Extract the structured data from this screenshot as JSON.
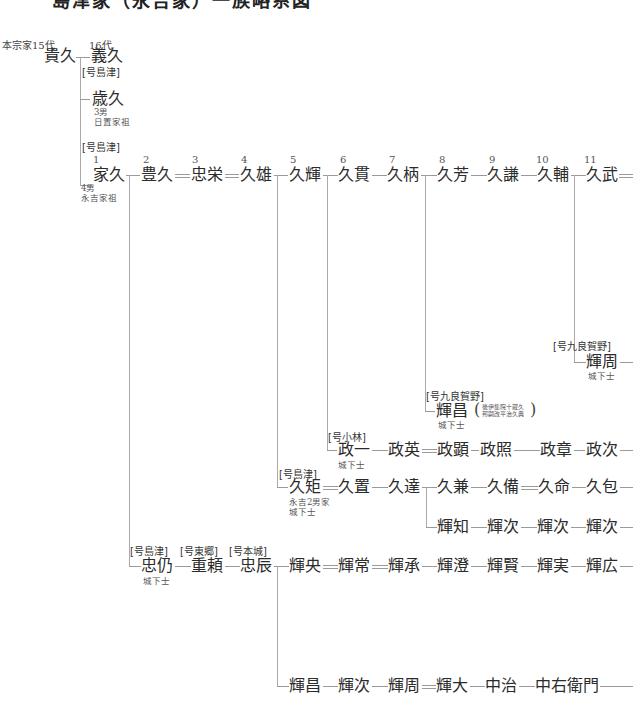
{
  "title": "島津家（永吉家）一族略系図",
  "top_labels": {
    "honsoke": "本宗家15代",
    "gen16": "16代"
  },
  "persons": {
    "takahisa": {
      "name": "貴久"
    },
    "yoshihisa": {
      "name": "義久"
    },
    "toshihisa": {
      "name": "歳久",
      "note": "3男\n日置家祖",
      "gou": "[号島津]"
    },
    "iehisa": {
      "name": "家久",
      "gen": "1",
      "note": "4男\n永吉家祖",
      "gou": "[号島津]"
    },
    "toyohisa": {
      "name": "豊久",
      "gen": "2"
    },
    "tadanaga": {
      "name": "忠栄",
      "gen": "3"
    },
    "hisao": {
      "name": "久雄",
      "gen": "4"
    },
    "hisateru": {
      "name": "久輝",
      "gen": "5"
    },
    "hisatsura": {
      "name": "久貫",
      "gen": "6"
    },
    "hisae": {
      "name": "久柄",
      "gen": "7"
    },
    "hisayoshi": {
      "name": "久芳",
      "gen": "8"
    },
    "hisakane_9": {
      "name": "久謙",
      "gen": "9"
    },
    "hisasuke": {
      "name": "久輔",
      "gen": "10"
    },
    "hisatake": {
      "name": "久武",
      "gen": "11"
    },
    "terachika": {
      "name": "輝周",
      "gou": "[号九良賀野]",
      "note": "城下士"
    },
    "terumasa": {
      "name": "輝昌",
      "gou": "[号九良賀野]",
      "note": "城下士",
      "paren_note": "後伊集院十蔵久\n邦嗣改平治久典"
    },
    "masakazu": {
      "name": "政一",
      "gou": "[号小林]",
      "note": "城下士"
    },
    "masahide": {
      "name": "政英"
    },
    "masaaki": {
      "name": "政顕"
    },
    "masateru": {
      "name": "政照"
    },
    "masaaki2": {
      "name": "政章"
    },
    "masatsugu": {
      "name": "政次"
    },
    "hisanori": {
      "name": "久矩",
      "gou": "[号島津]",
      "note": "永吉2男家\n城下士"
    },
    "hisaoki": {
      "name": "久置"
    },
    "hisatatsu": {
      "name": "久達"
    },
    "hisakane": {
      "name": "久兼"
    },
    "hisanari": {
      "name": "久備"
    },
    "hisanobu": {
      "name": "久命"
    },
    "hisakane2": {
      "name": "久包"
    },
    "terutomo": {
      "name": "輝知"
    },
    "terutsugu1": {
      "name": "輝次"
    },
    "terutsugu2": {
      "name": "輝次"
    },
    "terutsugu3": {
      "name": "輝次"
    },
    "tadanao": {
      "name": "忠仍",
      "gou": "[号島津]",
      "note": "城下士"
    },
    "shigeyori": {
      "name": "重頼",
      "gou": "[号東郷]"
    },
    "tadatoki": {
      "name": "忠辰",
      "gou": "[号本城]"
    },
    "teruhisa": {
      "name": "輝央"
    },
    "terutsune": {
      "name": "輝常"
    },
    "terutsugu_s": {
      "name": "輝承"
    },
    "terukiyo": {
      "name": "輝澄"
    },
    "terukata": {
      "name": "輝賢"
    },
    "terusane": {
      "name": "輝実"
    },
    "teruhiro": {
      "name": "輝広"
    },
    "terumasa2": {
      "name": "輝昌"
    },
    "terutsugu4": {
      "name": "輝次"
    },
    "terukane": {
      "name": "輝周"
    },
    "teruhiro2": {
      "name": "輝大"
    },
    "chuji": {
      "name": "中治"
    },
    "chuemon": {
      "name": "中右衛門"
    }
  }
}
